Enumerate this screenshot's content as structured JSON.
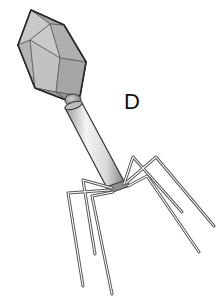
{
  "figure": {
    "label": "D",
    "parts": [
      "capsid-head",
      "collar",
      "tail-sheath",
      "baseplate",
      "tail-fibers"
    ]
  },
  "colors": {
    "capsid_fill": "#b8b8b8",
    "capsid_stroke": "#2a2a2a",
    "tail_light": "#f2f2f2",
    "tail_dark": "#8a8a8a",
    "outline": "#333333",
    "background": "#ffffff"
  }
}
